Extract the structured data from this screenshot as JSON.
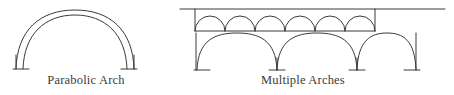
{
  "page": {
    "width": 454,
    "height": 95,
    "background_color": "#ffffff",
    "ink_color": "#3a3a3a",
    "style": "scanned black-and-white line drawing of architectural arch types"
  },
  "figures": [
    {
      "id": "parabolic-arch",
      "caption": "Parabolic Arch",
      "description": "A single tall parabolic arch drawn as two closely spaced nested curves (an arch ring of finite thickness), springing from two short vertical legs that rest on small horizontal base marks.",
      "arch_count": 1,
      "line_count": 2,
      "has_base_marks": true
    },
    {
      "id": "multiple-arches",
      "caption": "Multiple Arches",
      "description": "A two-tier arcade: an upper deck band containing six small semicircular arches between two horizontal deck lines, supported below by three large parabolic arches on slender piers with small base marks. The top horizontal line extends past the structure at both ends.",
      "upper_arch_count": 6,
      "lower_arch_count": 3,
      "pier_count": 4,
      "deck_lines": 2,
      "has_base_marks": true
    }
  ],
  "captions": {
    "parabolic": "Parabolic Arch",
    "multiple": "Multiple Arches"
  },
  "colors": {
    "ink": "#3a3a3a",
    "ink_light": "#4a4a4a",
    "background": "#ffffff"
  }
}
